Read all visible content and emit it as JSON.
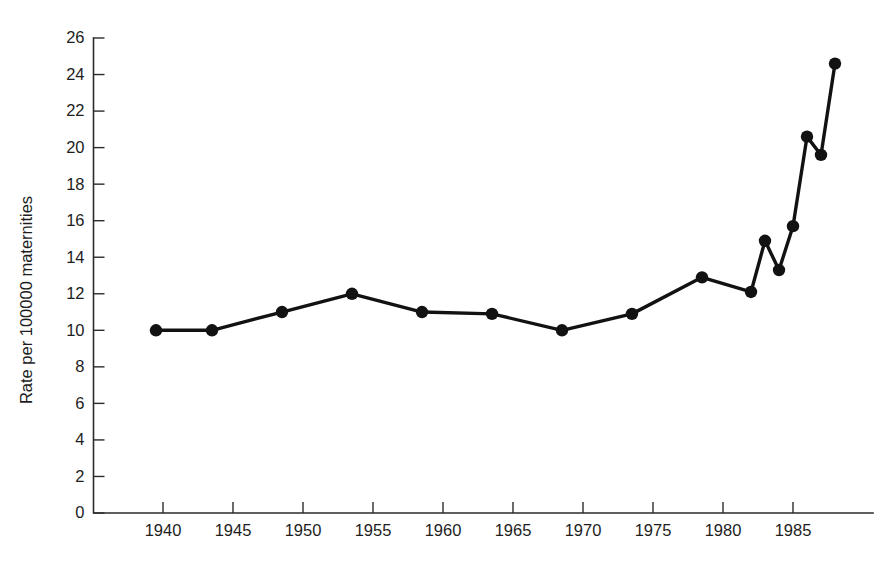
{
  "chart_data": {
    "type": "line",
    "title": "",
    "subtitle": "",
    "xlabel": "",
    "ylabel": "Rate per 100000 maternities",
    "xlim": [
      1937.5,
      1989.5
    ],
    "ylim": [
      0,
      26
    ],
    "grid": false,
    "legend": null,
    "marker": "filled-circle",
    "line_color": "#121212",
    "marker_color": "#121212",
    "x_ticks": [
      1940,
      1945,
      1950,
      1955,
      1960,
      1965,
      1970,
      1975,
      1980,
      1985
    ],
    "x_tick_labels": [
      "1940",
      "1945",
      "1950",
      "1955",
      "1960",
      "1965",
      "1970",
      "1975",
      "1980",
      "1985"
    ],
    "y_ticks": [
      0,
      2,
      4,
      6,
      8,
      10,
      12,
      14,
      16,
      18,
      20,
      22,
      24,
      26
    ],
    "y_tick_labels": [
      "0",
      "2",
      "4",
      "6",
      "8",
      "10",
      "12",
      "14",
      "16",
      "18",
      "20",
      "22",
      "24",
      "26"
    ],
    "series": [
      {
        "name": "Rate per 100000 maternities",
        "x": [
          1939.5,
          1943.5,
          1948.5,
          1953.5,
          1958.5,
          1963.5,
          1968.5,
          1973.5,
          1978.5,
          1982.0,
          1983.0,
          1984.0,
          1985.0,
          1986.0,
          1987.0,
          1988.0
        ],
        "values": [
          10.0,
          10.0,
          11.0,
          12.0,
          11.0,
          10.9,
          10.0,
          10.9,
          12.9,
          12.1,
          14.9,
          13.3,
          15.7,
          20.6,
          19.6,
          24.6
        ]
      }
    ],
    "points": [
      {
        "x": 1939.5,
        "y": 10.0
      },
      {
        "x": 1943.5,
        "y": 10.0
      },
      {
        "x": 1948.5,
        "y": 11.0
      },
      {
        "x": 1953.5,
        "y": 12.0
      },
      {
        "x": 1958.5,
        "y": 11.0
      },
      {
        "x": 1963.5,
        "y": 10.9
      },
      {
        "x": 1968.5,
        "y": 10.0
      },
      {
        "x": 1973.5,
        "y": 10.9
      },
      {
        "x": 1978.5,
        "y": 12.9
      },
      {
        "x": 1982.0,
        "y": 12.1
      },
      {
        "x": 1983.0,
        "y": 14.9
      },
      {
        "x": 1984.0,
        "y": 13.3
      },
      {
        "x": 1985.0,
        "y": 15.7
      },
      {
        "x": 1986.0,
        "y": 20.6
      },
      {
        "x": 1987.0,
        "y": 19.6
      },
      {
        "x": 1988.0,
        "y": 24.6
      }
    ]
  }
}
